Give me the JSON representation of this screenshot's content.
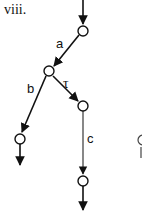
{
  "figure": {
    "label": "viii."
  },
  "diagram": {
    "type": "transition-tree",
    "nodes": [
      {
        "id": "n0",
        "x": 83,
        "y": 31
      },
      {
        "id": "n1",
        "x": 49,
        "y": 71
      },
      {
        "id": "n2",
        "x": 20,
        "y": 139
      },
      {
        "id": "n3",
        "x": 83,
        "y": 106
      },
      {
        "id": "n4",
        "x": 83,
        "y": 181
      },
      {
        "id": "n5",
        "x": 143,
        "y": 140
      }
    ],
    "edges": [
      {
        "from": "n0",
        "to": "n1",
        "label": "a"
      },
      {
        "from": "n1",
        "to": "n2",
        "label": "b"
      },
      {
        "from": "n1",
        "to": "n3",
        "label": "τ"
      },
      {
        "from": "n3",
        "to": "n4",
        "label": "c"
      }
    ],
    "edge_labels": {
      "a": "a",
      "b": "b",
      "tau": "τ",
      "c": "c"
    },
    "colors": {
      "stroke": "#111111",
      "edge_c": "#555555",
      "background": "#ffffff"
    }
  }
}
